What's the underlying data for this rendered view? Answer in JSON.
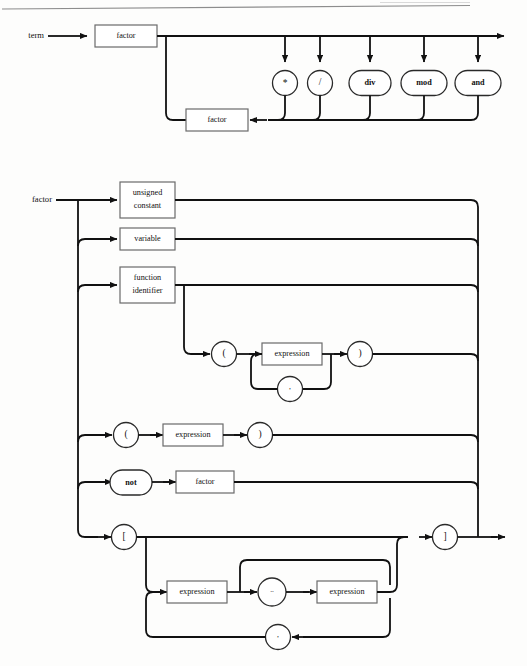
{
  "page": {
    "width": 527,
    "height": 666,
    "background": "#fdfdfc",
    "ink": "#111111",
    "box_stroke": "#6a6a6a"
  },
  "header": {
    "rule_visible": true,
    "partial_text": ""
  },
  "diagrams": [
    {
      "id": "term",
      "entry_label": "term",
      "nodes": {
        "factor_main": {
          "kind": "box",
          "label": "factor"
        },
        "factor_loop": {
          "kind": "box",
          "label": "factor"
        },
        "operators": [
          {
            "kind": "circle",
            "label": "*"
          },
          {
            "kind": "circle",
            "label": "/"
          },
          {
            "kind": "stadium",
            "label": "div"
          },
          {
            "kind": "stadium",
            "label": "mod"
          },
          {
            "kind": "stadium",
            "label": "and"
          }
        ]
      }
    },
    {
      "id": "factor",
      "entry_label": "factor",
      "alternatives": [
        {
          "kind": "box",
          "label": "unsigned\nconstant",
          "line1": "unsigned",
          "line2": "constant"
        },
        {
          "kind": "box",
          "label": "variable"
        },
        {
          "kind": "box",
          "label": "function\nidentifier",
          "line1": "function",
          "line2": "identifier"
        },
        {
          "kind": "group",
          "label": "function call arguments"
        },
        {
          "kind": "group",
          "label": "parenthesized expression"
        },
        {
          "kind": "group",
          "label": "not factor"
        },
        {
          "kind": "group",
          "label": "set constructor"
        }
      ],
      "nodes": {
        "lparen_args": {
          "kind": "circle",
          "label": "("
        },
        "expression_args": {
          "kind": "box",
          "label": "expression"
        },
        "rparen_args": {
          "kind": "circle",
          "label": ")"
        },
        "comma_args": {
          "kind": "circle",
          "label": ","
        },
        "lparen_expr": {
          "kind": "circle",
          "label": "("
        },
        "expression_paren": {
          "kind": "box",
          "label": "expression"
        },
        "rparen_expr": {
          "kind": "circle",
          "label": ")"
        },
        "not_kw": {
          "kind": "stadium",
          "label": "not"
        },
        "factor_not": {
          "kind": "box",
          "label": "factor"
        },
        "lbracket": {
          "kind": "circle",
          "label": "["
        },
        "expression_low": {
          "kind": "box",
          "label": "expression"
        },
        "range_dots": {
          "kind": "circle",
          "label": ".."
        },
        "expression_high": {
          "kind": "box",
          "label": "expression"
        },
        "rbracket": {
          "kind": "circle",
          "label": "]"
        },
        "comma_set": {
          "kind": "circle",
          "label": ","
        }
      }
    }
  ]
}
